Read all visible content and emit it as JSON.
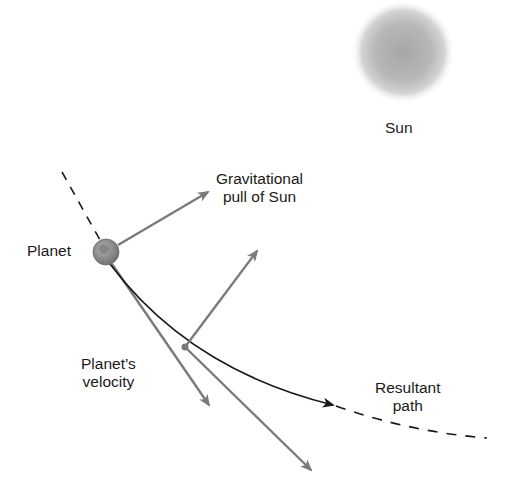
{
  "diagram": {
    "colors": {
      "background": "#ffffff",
      "arrow_gray": "#7a7a7a",
      "path_black": "#1a1a1a",
      "sun_center": "#a9a9a9",
      "planet": "#8f8f8f",
      "text": "#1a1a1a"
    },
    "labels": {
      "sun": "Sun",
      "planet": "Planet",
      "gravity_line1": "Gravitational",
      "gravity_line2": "pull of Sun",
      "velocity_line1": "Planet’s",
      "velocity_line2": "velocity",
      "resultant_line1": "Resultant",
      "resultant_line2": "path"
    },
    "elements": {
      "sun": {
        "cx": 403,
        "cy": 52,
        "r": 50
      },
      "planet": {
        "cx": 106,
        "cy": 252,
        "r": 13
      },
      "midpoint": {
        "cx": 185,
        "cy": 347,
        "r": 3.5
      },
      "prior_orbit_dashed": {
        "from": [
          62,
          172
        ],
        "to": [
          100,
          240
        ]
      },
      "gravity_arrow_1": {
        "from": [
          118,
          245
        ],
        "to": [
          208,
          192
        ]
      },
      "velocity_arrow_1": {
        "from": [
          112,
          264
        ],
        "to": [
          209,
          405
        ]
      },
      "gravity_arrow_2": {
        "from": [
          185,
          347
        ],
        "to": [
          257,
          251
        ]
      },
      "velocity_arrow_2": {
        "from": [
          185,
          347
        ],
        "to": [
          311,
          470
        ]
      },
      "resultant_path_solid": {
        "from": [
          110,
          264
        ],
        "to": [
          331,
          405
        ]
      },
      "resultant_path_dashed": {
        "from": [
          336,
          406
        ],
        "to": [
          487,
          440
        ]
      }
    }
  }
}
